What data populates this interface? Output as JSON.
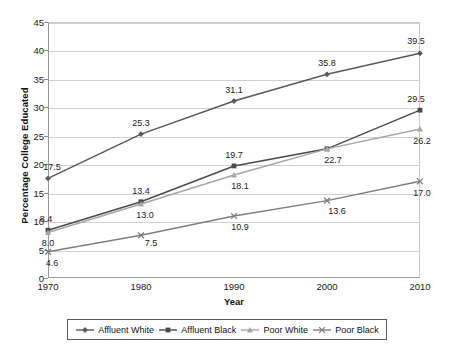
{
  "chart_data": {
    "type": "line",
    "title": "",
    "xlabel": "Year",
    "ylabel": "Percentage College Educated",
    "categories": [
      "1970",
      "1980",
      "1990",
      "2000",
      "2010"
    ],
    "x": [
      1970,
      1980,
      1990,
      2000,
      2010
    ],
    "ylim": [
      0,
      45
    ],
    "yticks": [
      0,
      5,
      10,
      15,
      20,
      25,
      30,
      35,
      40,
      45
    ],
    "grid": true,
    "legend_position": "bottom",
    "series": [
      {
        "name": "Affluent White",
        "marker": "diamond",
        "color": "#595959",
        "values": [
          17.5,
          25.3,
          31.1,
          35.8,
          39.5
        ],
        "labels": [
          "17.5",
          "25.3",
          "31.1",
          "35.8",
          "39.5"
        ]
      },
      {
        "name": "Affluent Black",
        "marker": "square",
        "color": "#4a4a4a",
        "values": [
          8.4,
          13.4,
          19.7,
          22.7,
          29.5
        ],
        "labels": [
          "8.4",
          "13.4",
          "19.7",
          "22.7",
          "29.5"
        ]
      },
      {
        "name": "Poor White",
        "marker": "triangle",
        "color": "#a6a6a6",
        "values": [
          8.0,
          13.0,
          18.1,
          22.7,
          26.2
        ],
        "labels": [
          "8.0",
          "13.0",
          "18.1",
          "",
          "26.2"
        ]
      },
      {
        "name": "Poor Black",
        "marker": "cross",
        "color": "#7f7f7f",
        "values": [
          4.6,
          7.5,
          10.9,
          13.6,
          17.0
        ],
        "labels": [
          "4.6",
          "7.5",
          "10.9",
          "13.6",
          "17.0"
        ]
      }
    ]
  },
  "axes": {
    "y_title": "Percentage College Educated",
    "x_title": "Year",
    "y_tick_labels": [
      "45",
      "40",
      "35",
      "30",
      "25",
      "20",
      "15",
      "10",
      "5",
      "0"
    ],
    "x_tick_labels": [
      "1970",
      "1980",
      "1990",
      "2000",
      "2010"
    ]
  },
  "legend": {
    "items": [
      {
        "label": "Affluent White",
        "marker": "diamond",
        "color": "#595959"
      },
      {
        "label": "Affluent Black",
        "marker": "square",
        "color": "#4a4a4a"
      },
      {
        "label": "Poor White",
        "marker": "triangle",
        "color": "#a6a6a6"
      },
      {
        "label": "Poor Black",
        "marker": "cross",
        "color": "#7f7f7f"
      }
    ]
  }
}
